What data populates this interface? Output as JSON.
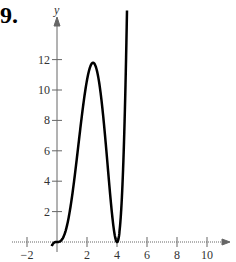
{
  "problem_number": "9.",
  "chart_data": {
    "type": "line",
    "title": "",
    "xlabel": "",
    "ylabel": "y",
    "xlim": [
      -2.5,
      11
    ],
    "ylim": [
      -1,
      13.5
    ],
    "x_ticks": [
      -2,
      2,
      4,
      6,
      8,
      10
    ],
    "y_ticks": [
      2,
      4,
      6,
      8,
      10,
      12
    ],
    "function": "y = x^3 (x-4)^2 / 3",
    "series": [
      {
        "name": "f(x)",
        "x": [
          -0.3,
          0,
          0.5,
          1,
          1.5,
          2,
          2.4,
          3,
          3.5,
          4,
          4.3,
          4.6
        ],
        "y": [
          -0.17,
          0,
          0.51,
          3,
          7.6,
          10.7,
          11.8,
          9,
          3.6,
          0,
          2.47,
          11.7
        ]
      }
    ],
    "grid": false
  }
}
